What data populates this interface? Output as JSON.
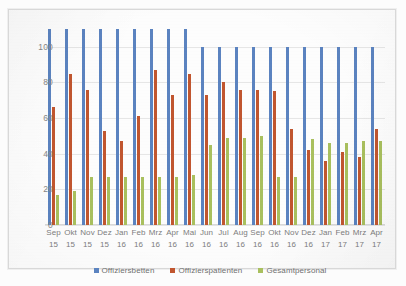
{
  "chart_data": {
    "type": "bar",
    "title": "",
    "xlabel": "",
    "ylabel": "",
    "ylim": [
      0,
      110
    ],
    "yticks": [
      0,
      20,
      40,
      60,
      80,
      100
    ],
    "grid": true,
    "legend_position": "bottom",
    "categories": [
      "Sep 15",
      "Okt 15",
      "Nov 15",
      "Dez 15",
      "Jan 16",
      "Feb 16",
      "Mrz 16",
      "Apr 16",
      "Mai 16",
      "Jun 16",
      "Jul 16",
      "Aug 16",
      "Sep 16",
      "Okt 16",
      "Nov 16",
      "Dez 16",
      "Jan 17",
      "Feb 17",
      "Mrz 17",
      "Apr 17"
    ],
    "category_months": [
      "Sep",
      "Okt",
      "Nov",
      "Dez",
      "Jan",
      "Feb",
      "Mrz",
      "Apr",
      "Mai",
      "Jun",
      "Jul",
      "Aug",
      "Sep",
      "Okt",
      "Nov",
      "Dez",
      "Jan",
      "Feb",
      "Mrz",
      "Apr"
    ],
    "category_years": [
      "15",
      "15",
      "15",
      "15",
      "16",
      "16",
      "16",
      "16",
      "16",
      "16",
      "16",
      "16",
      "16",
      "16",
      "16",
      "16",
      "17",
      "17",
      "17",
      "17"
    ],
    "series": [
      {
        "name": "Offiziersbetten",
        "color": "#5b83c0",
        "values": [
          110,
          110,
          110,
          110,
          110,
          110,
          110,
          110,
          110,
          100,
          100,
          100,
          100,
          100,
          100,
          100,
          100,
          100,
          100,
          100
        ]
      },
      {
        "name": "Offizierspatienten",
        "color": "#c1562f",
        "values": [
          66,
          85,
          76,
          53,
          47,
          61,
          87,
          73,
          85,
          73,
          80,
          76,
          76,
          75,
          54,
          42,
          36,
          41,
          38,
          54
        ]
      },
      {
        "name": "Gesamtpersonal",
        "color": "#a9c05e",
        "values": [
          17,
          19,
          27,
          27,
          27,
          27,
          27,
          27,
          28,
          45,
          49,
          49,
          50,
          27,
          27,
          48,
          46,
          46,
          47,
          47
        ]
      }
    ]
  },
  "legend": {
    "items": [
      {
        "label": "Offiziersbetten",
        "color": "#5b83c0"
      },
      {
        "label": "Offizierspatienten",
        "color": "#c1562f"
      },
      {
        "label": "Gesamtpersonal",
        "color": "#a9c05e"
      }
    ]
  }
}
